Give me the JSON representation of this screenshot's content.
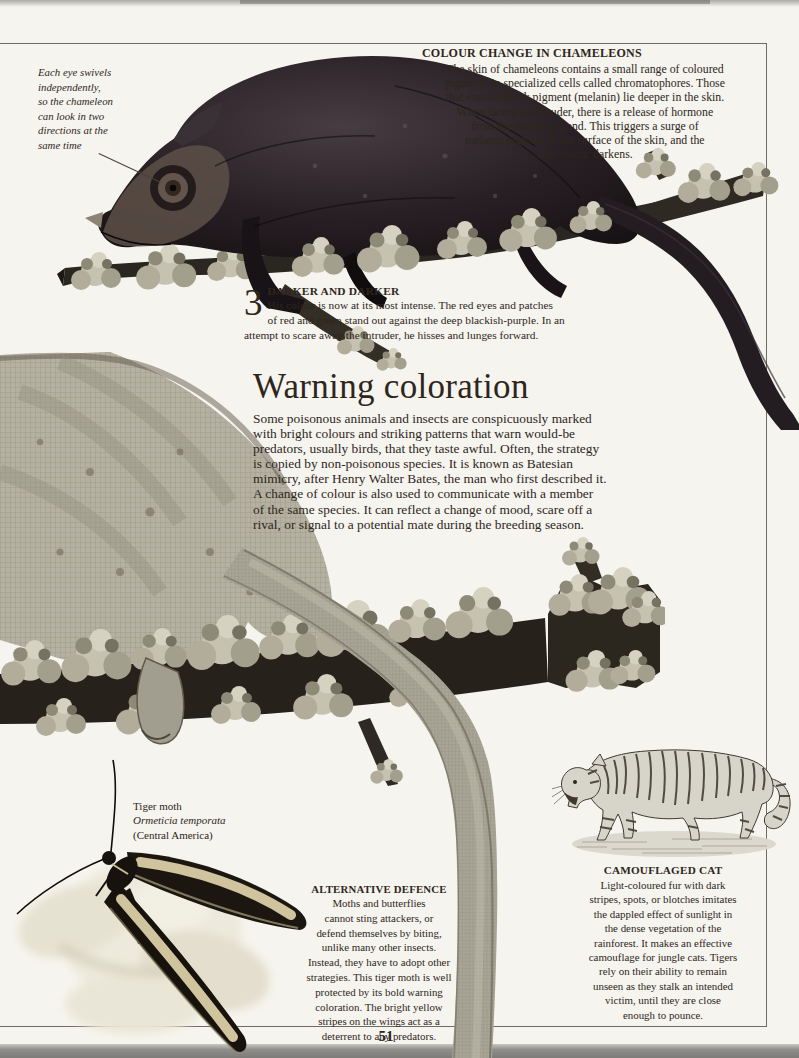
{
  "page": {
    "number": "51",
    "paper_color": "#f6f4ee",
    "ink_color": "#2e261c",
    "frame_color": "#6f6b62",
    "moth_stripe_color": "#cfc49e",
    "lichen_color": "#c6c2b1"
  },
  "captions": {
    "eye": "Each eye swivels\nindependently,\nso the chameleon\ncan look in two\ndirections at the\nsame time",
    "tiger_moth": {
      "common_name": "Tiger moth",
      "species": "Ormeticia temporata",
      "origin": "(Central America)"
    }
  },
  "sections": {
    "colour_change": {
      "heading": "COLOUR CHANGE IN CHAMELEONS",
      "body": "The skin of chameleons contains a small range of coloured\npigments in specialized cells called chromatophores. Those\nthat contain black pigment (melanin) lie deeper in the skin.\nWhen facing an intruder, there is a release of hormone\nfrom the pituitary gland. This triggers a surge of\nmelanin pigment to the surface of the skin, and the\nskin colour darkens."
    },
    "darker_and_darker": {
      "step_number": "3",
      "heading": "DARKER AND DARKER",
      "body": "His colour is now at its most intense. The red eyes and patches\nof red and green stand out against the deep blackish-purple. In an\nattempt to scare away the intruder, he hisses and lunges forward."
    },
    "warning_coloration": {
      "title": "Warning coloration",
      "body": "Some poisonous animals and insects are conspicuously marked\nwith bright colours and striking patterns that warn would-be\npredators, usually birds, that they taste awful. Often, the strategy\nis copied by non-poisonous species. It is known as Batesian\nmimicry, after Henry Walter Bates, the man who first described it.\nA change of colour is also used to communicate with a member\nof the same species. It can reflect a change of mood, scare off a\nrival, or signal to a potential mate during the breeding season."
    },
    "alternative_defence": {
      "heading": "ALTERNATIVE DEFENCE",
      "body": "Moths and butterflies\ncannot sting attackers, or\ndefend themselves by biting,\nunlike many other insects.\nInstead, they have to adopt other\nstrategies. This tiger moth is well\nprotected by its bold warning\ncoloration. The bright yellow\nstripes on the wings act as a\ndeterrent to any predators."
    },
    "camouflaged_cat": {
      "heading": "CAMOUFLAGED CAT",
      "body": "Light-coloured fur with dark\nstripes, spots, or blotches imitates\nthe dappled effect of sunlight in\nthe dense vegetation of the\nrainforest. It makes an effective\ncamouflage for jungle cats. Tigers\nrely on their ability to remain\nunseen as they stalk an intended\nvictim, until they are close\nenough to pounce."
    }
  },
  "figures": {
    "dark_chameleon": "Chameleon in its darkest threat coloration resting on a lichen-covered branch",
    "chameleon_closeup": "Close-up of a chameleon's flank, leg and hanging tail on a lichen-covered branch",
    "tiger": "Engraving of a walking tiger",
    "tiger_moth": "Black tiger moth with pale yellow wing stripes resting on a pale flower"
  }
}
